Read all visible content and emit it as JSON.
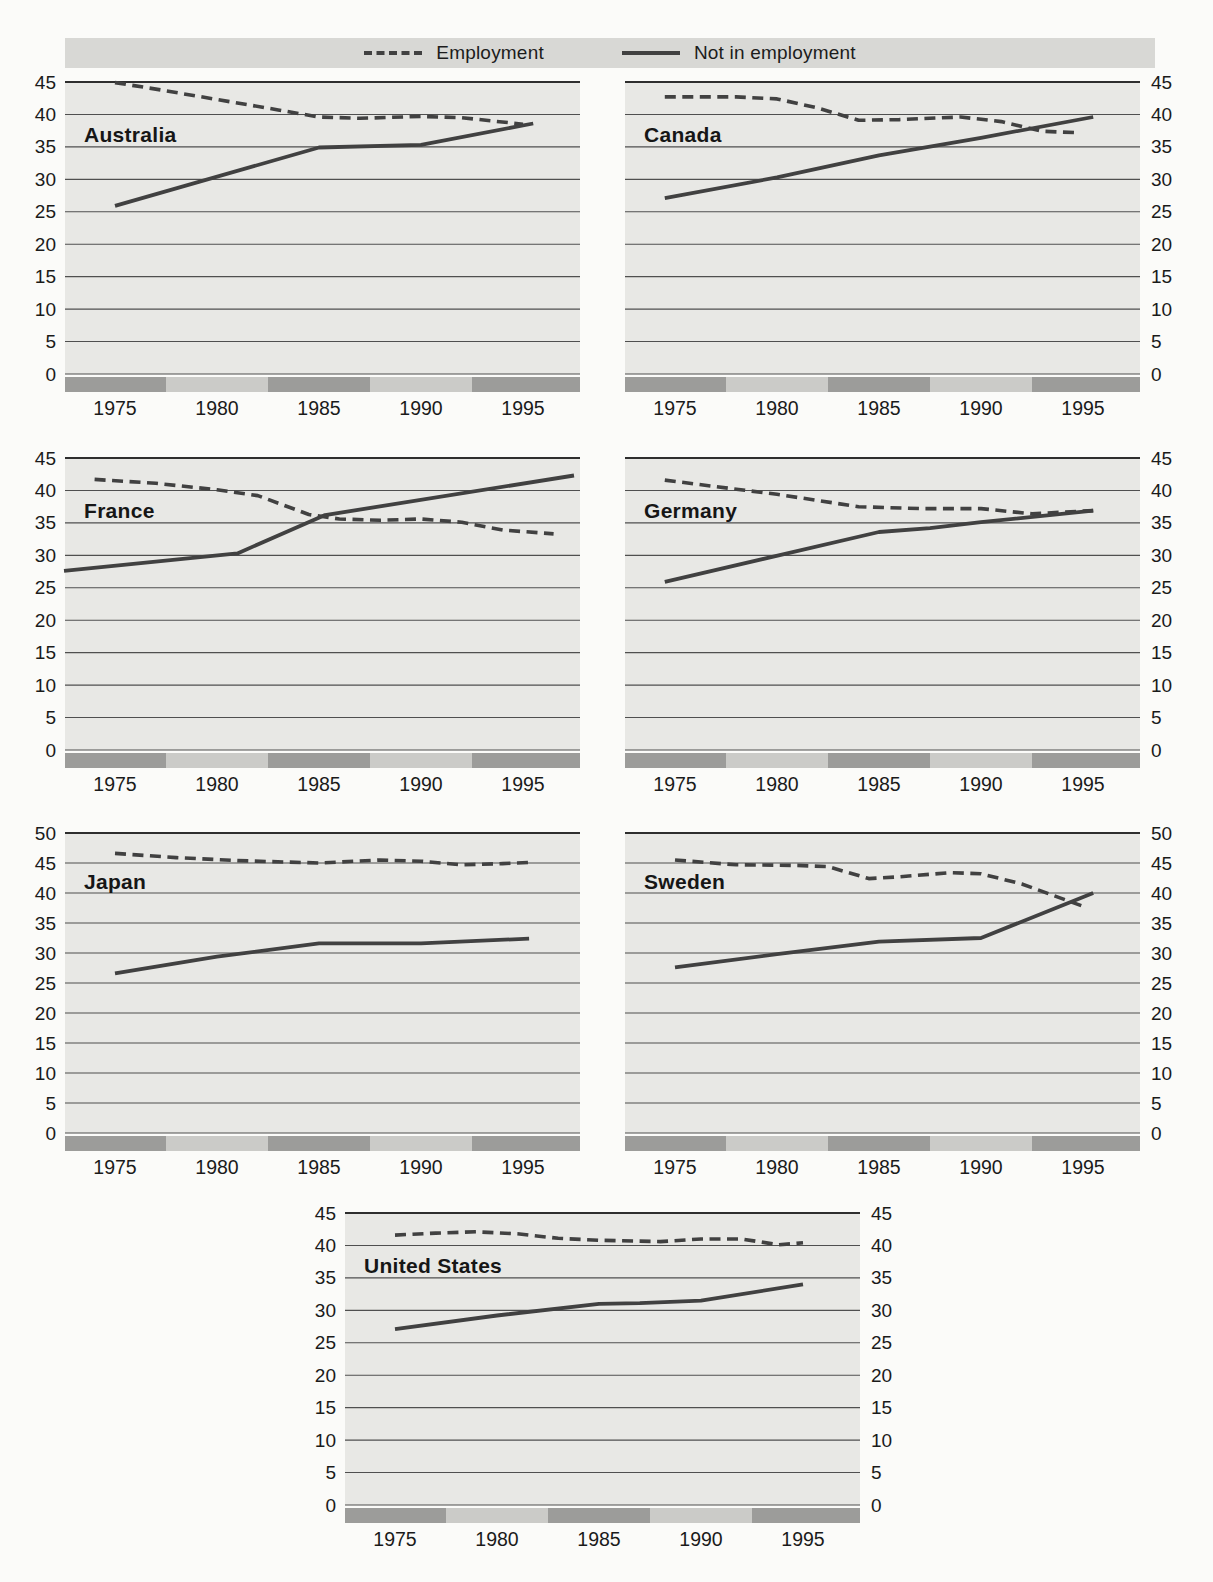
{
  "page": {
    "width": 1213,
    "height": 1582
  },
  "style": {
    "page_bg": "#fbfbf9",
    "plot_bg": "#e8e8e5",
    "legend_band_bg": "#d8d8d5",
    "grid_color": "#4f4f4f",
    "grid_top_color": "#2e2e2e",
    "line_color": "#414141",
    "band_dark": "#9c9c9a",
    "band_light": "#cbcbc8",
    "text_color": "#1a1a1a"
  },
  "legend": {
    "items": [
      {
        "id": "employment",
        "label": "Employment",
        "line_style": "dashed"
      },
      {
        "id": "not-in-employment",
        "label": "Not in employment",
        "line_style": "solid"
      }
    ]
  },
  "chart_data": [
    {
      "id": "australia",
      "country": "Australia",
      "type": "line",
      "ylim": [
        0,
        45
      ],
      "yticks": [
        45,
        40,
        35,
        30,
        25,
        20,
        15,
        10,
        5,
        0
      ],
      "xticks": [
        1975,
        1980,
        1985,
        1990,
        1995
      ],
      "yticks_side": "left",
      "series": [
        {
          "name": "Employment",
          "line_style": "dashed",
          "points": [
            [
              1975,
              44.9
            ],
            [
              1977,
              43.9
            ],
            [
              1980,
              42.3
            ],
            [
              1983,
              40.7
            ],
            [
              1985,
              39.6
            ],
            [
              1987,
              39.4
            ],
            [
              1990,
              39.7
            ],
            [
              1992,
              39.5
            ],
            [
              1995,
              38.5
            ]
          ]
        },
        {
          "name": "Not in employment",
          "line_style": "solid",
          "points": [
            [
              1975,
              25.9
            ],
            [
              1985,
              34.9
            ],
            [
              1990,
              35.3
            ],
            [
              1995.5,
              38.6
            ]
          ]
        }
      ]
    },
    {
      "id": "canada",
      "country": "Canada",
      "type": "line",
      "ylim": [
        0,
        45
      ],
      "yticks": [
        45,
        40,
        35,
        30,
        25,
        20,
        15,
        10,
        5,
        0
      ],
      "xticks": [
        1975,
        1980,
        1985,
        1990,
        1995
      ],
      "yticks_side": "right",
      "series": [
        {
          "name": "Employment",
          "line_style": "dashed",
          "points": [
            [
              1974.5,
              42.7
            ],
            [
              1978,
              42.7
            ],
            [
              1980,
              42.4
            ],
            [
              1982,
              41.0
            ],
            [
              1984,
              39.1
            ],
            [
              1986,
              39.2
            ],
            [
              1989,
              39.6
            ],
            [
              1991,
              38.9
            ],
            [
              1993,
              37.4
            ],
            [
              1994.7,
              37.2
            ]
          ]
        },
        {
          "name": "Not in employment",
          "line_style": "solid",
          "points": [
            [
              1974.5,
              27.1
            ],
            [
              1980,
              30.3
            ],
            [
              1985,
              33.7
            ],
            [
              1990,
              36.4
            ],
            [
              1995.5,
              39.6
            ]
          ]
        }
      ]
    },
    {
      "id": "france",
      "country": "France",
      "type": "line",
      "ylim": [
        0,
        45
      ],
      "yticks": [
        45,
        40,
        35,
        30,
        25,
        20,
        15,
        10,
        5,
        0
      ],
      "xticks": [
        1975,
        1980,
        1985,
        1990,
        1995
      ],
      "yticks_side": "left",
      "series": [
        {
          "name": "Employment",
          "line_style": "dashed",
          "points": [
            [
              1974,
              41.7
            ],
            [
              1977,
              41.1
            ],
            [
              1980,
              40.1
            ],
            [
              1982,
              39.2
            ],
            [
              1984.5,
              36.3
            ],
            [
              1986,
              35.6
            ],
            [
              1988,
              35.4
            ],
            [
              1990,
              35.6
            ],
            [
              1992,
              35.1
            ],
            [
              1994,
              33.9
            ],
            [
              1996.5,
              33.3
            ]
          ]
        },
        {
          "name": "Not in employment",
          "line_style": "solid",
          "points": [
            [
              1972.5,
              27.6
            ],
            [
              1981,
              30.3
            ],
            [
              1985.3,
              36.2
            ],
            [
              1997.5,
              42.3
            ]
          ]
        }
      ]
    },
    {
      "id": "germany",
      "country": "Germany",
      "type": "line",
      "ylim": [
        0,
        45
      ],
      "yticks": [
        45,
        40,
        35,
        30,
        25,
        20,
        15,
        10,
        5,
        0
      ],
      "xticks": [
        1975,
        1980,
        1985,
        1990,
        1995
      ],
      "yticks_side": "right",
      "series": [
        {
          "name": "Employment",
          "line_style": "dashed",
          "points": [
            [
              1974.5,
              41.6
            ],
            [
              1977,
              40.6
            ],
            [
              1980,
              39.4
            ],
            [
              1984,
              37.5
            ],
            [
              1987,
              37.2
            ],
            [
              1990,
              37.2
            ],
            [
              1992.5,
              36.4
            ],
            [
              1995.5,
              36.9
            ]
          ]
        },
        {
          "name": "Not in employment",
          "line_style": "solid",
          "points": [
            [
              1974.5,
              25.9
            ],
            [
              1985,
              33.6
            ],
            [
              1987.5,
              34.2
            ],
            [
              1990,
              35.1
            ],
            [
              1995.5,
              36.9
            ]
          ]
        }
      ]
    },
    {
      "id": "japan",
      "country": "Japan",
      "type": "line",
      "ylim": [
        0,
        50
      ],
      "yticks": [
        50,
        45,
        40,
        35,
        30,
        25,
        20,
        15,
        10,
        5,
        0
      ],
      "xticks": [
        1975,
        1980,
        1985,
        1990,
        1995
      ],
      "yticks_side": "left",
      "series": [
        {
          "name": "Employment",
          "line_style": "dashed",
          "points": [
            [
              1975,
              46.6
            ],
            [
              1978,
              45.9
            ],
            [
              1981,
              45.4
            ],
            [
              1985,
              45.0
            ],
            [
              1988,
              45.5
            ],
            [
              1990,
              45.3
            ],
            [
              1992,
              44.7
            ],
            [
              1994,
              44.9
            ],
            [
              1995.3,
              45.1
            ]
          ]
        },
        {
          "name": "Not in employment",
          "line_style": "solid",
          "points": [
            [
              1975,
              26.6
            ],
            [
              1980,
              29.4
            ],
            [
              1985,
              31.6
            ],
            [
              1990,
              31.6
            ],
            [
              1995.3,
              32.4
            ]
          ]
        }
      ]
    },
    {
      "id": "sweden",
      "country": "Sweden",
      "type": "line",
      "ylim": [
        0,
        50
      ],
      "yticks": [
        50,
        45,
        40,
        35,
        30,
        25,
        20,
        15,
        10,
        5,
        0
      ],
      "xticks": [
        1975,
        1980,
        1985,
        1990,
        1995
      ],
      "yticks_side": "right",
      "series": [
        {
          "name": "Employment",
          "line_style": "dashed",
          "points": [
            [
              1975,
              45.5
            ],
            [
              1978,
              44.7
            ],
            [
              1981,
              44.6
            ],
            [
              1982.5,
              44.4
            ],
            [
              1984.5,
              42.4
            ],
            [
              1986,
              42.7
            ],
            [
              1988.5,
              43.4
            ],
            [
              1990,
              43.2
            ],
            [
              1992,
              41.5
            ],
            [
              1995,
              37.8
            ]
          ]
        },
        {
          "name": "Not in employment",
          "line_style": "solid",
          "points": [
            [
              1975,
              27.6
            ],
            [
              1980,
              29.8
            ],
            [
              1985,
              31.9
            ],
            [
              1990,
              32.5
            ],
            [
              1995.5,
              40.0
            ]
          ]
        }
      ]
    },
    {
      "id": "united-states",
      "country": "United States",
      "type": "line",
      "ylim": [
        0,
        45
      ],
      "yticks": [
        45,
        40,
        35,
        30,
        25,
        20,
        15,
        10,
        5,
        0
      ],
      "xticks": [
        1975,
        1980,
        1985,
        1990,
        1995
      ],
      "yticks_side": "both",
      "series": [
        {
          "name": "Employment",
          "line_style": "dashed",
          "points": [
            [
              1975,
              41.6
            ],
            [
              1977,
              41.9
            ],
            [
              1979,
              42.1
            ],
            [
              1981,
              41.8
            ],
            [
              1983,
              41.1
            ],
            [
              1985,
              40.8
            ],
            [
              1988,
              40.6
            ],
            [
              1990,
              41.0
            ],
            [
              1992,
              41.0
            ],
            [
              1993.8,
              40.1
            ],
            [
              1995,
              40.4
            ]
          ]
        },
        {
          "name": "Not in employment",
          "line_style": "solid",
          "points": [
            [
              1975,
              27.1
            ],
            [
              1980,
              29.2
            ],
            [
              1985,
              31.0
            ],
            [
              1987,
              31.1
            ],
            [
              1990,
              31.5
            ],
            [
              1995,
              34.0
            ]
          ]
        }
      ]
    }
  ]
}
